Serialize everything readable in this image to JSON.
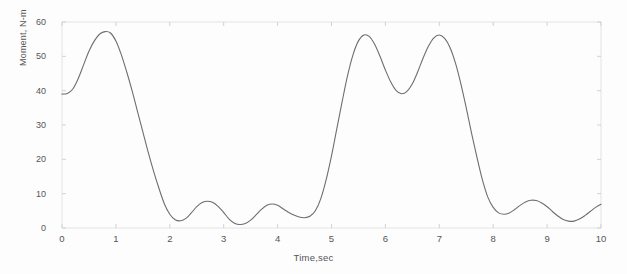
{
  "chart_data": {
    "type": "line",
    "title": "",
    "xlabel": "Time,sec",
    "ylabel": "Moment, N-m",
    "xlim": [
      0,
      10
    ],
    "ylim": [
      0,
      60
    ],
    "xticks": [
      "0",
      "1",
      "2",
      "3",
      "4",
      "5",
      "6",
      "7",
      "8",
      "9",
      "10"
    ],
    "yticks": [
      "0",
      "10",
      "20",
      "30",
      "40",
      "50",
      "60"
    ],
    "grid": false,
    "legend": null,
    "line_color": "#6e6e6e",
    "series": [
      {
        "name": "Moment",
        "x": [
          0.0,
          0.1,
          0.2,
          0.3,
          0.4,
          0.5,
          0.6,
          0.7,
          0.8,
          0.9,
          1.0,
          1.1,
          1.2,
          1.3,
          1.4,
          1.5,
          1.6,
          1.7,
          1.8,
          1.9,
          2.0,
          2.1,
          2.2,
          2.3,
          2.4,
          2.5,
          2.6,
          2.7,
          2.8,
          2.9,
          3.0,
          3.1,
          3.2,
          3.3,
          3.4,
          3.5,
          3.6,
          3.7,
          3.8,
          3.9,
          4.0,
          4.1,
          4.2,
          4.3,
          4.4,
          4.5,
          4.6,
          4.7,
          4.8,
          4.9,
          5.0,
          5.1,
          5.2,
          5.3,
          5.4,
          5.5,
          5.6,
          5.7,
          5.8,
          5.9,
          6.0,
          6.1,
          6.2,
          6.3,
          6.4,
          6.5,
          6.6,
          6.7,
          6.8,
          6.9,
          7.0,
          7.1,
          7.2,
          7.3,
          7.4,
          7.5,
          7.6,
          7.7,
          7.8,
          7.9,
          8.0,
          8.1,
          8.2,
          8.3,
          8.4,
          8.5,
          8.6,
          8.7,
          8.8,
          8.9,
          9.0,
          9.1,
          9.2,
          9.3,
          9.4,
          9.5,
          9.6,
          9.7,
          9.8,
          9.9,
          10.0
        ],
        "y": [
          39.0,
          39.2,
          40.5,
          43.5,
          47.5,
          51.5,
          54.5,
          56.5,
          57.2,
          56.8,
          54.5,
          50.5,
          45.5,
          40.0,
          34.0,
          28.0,
          22.0,
          16.5,
          11.5,
          7.0,
          4.0,
          2.4,
          2.1,
          2.8,
          4.4,
          6.2,
          7.4,
          7.8,
          7.4,
          6.2,
          4.5,
          2.6,
          1.4,
          1.0,
          1.3,
          2.3,
          3.8,
          5.4,
          6.6,
          7.0,
          6.6,
          5.6,
          4.6,
          3.8,
          3.2,
          3.0,
          3.4,
          5.0,
          8.5,
          14.0,
          21.0,
          29.0,
          37.0,
          44.5,
          50.5,
          54.5,
          56.2,
          55.8,
          53.5,
          50.0,
          46.0,
          42.5,
          40.0,
          39.1,
          39.8,
          42.0,
          45.5,
          49.5,
          53.0,
          55.4,
          56.2,
          55.2,
          52.5,
          48.0,
          42.0,
          35.0,
          27.5,
          20.5,
          14.0,
          9.0,
          6.0,
          4.4,
          4.0,
          4.4,
          5.4,
          6.6,
          7.6,
          8.1,
          8.0,
          7.3,
          6.2,
          4.8,
          3.5,
          2.5,
          2.0,
          2.0,
          2.6,
          3.6,
          4.8,
          6.0,
          6.9
        ]
      }
    ]
  },
  "axes": {
    "frame_color": "#dcdcdc",
    "tick_color": "#c8c8c8"
  }
}
